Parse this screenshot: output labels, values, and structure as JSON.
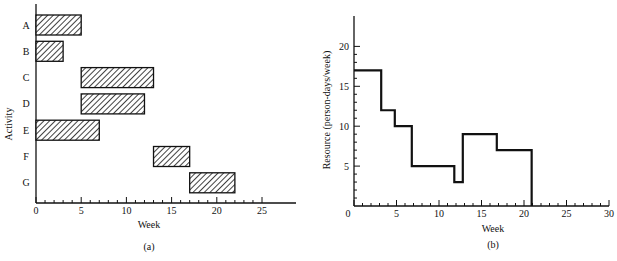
{
  "chart_data": [
    {
      "type": "bar",
      "subtype": "gantt",
      "caption": "(a)",
      "xlabel": "Week",
      "ylabel": "Activity",
      "xlim": [
        0,
        28
      ],
      "xticks": [
        0,
        5,
        10,
        15,
        20,
        25
      ],
      "categories": [
        "A",
        "B",
        "C",
        "D",
        "E",
        "F",
        "G"
      ],
      "bars": [
        {
          "activity": "A",
          "start": 0,
          "end": 5
        },
        {
          "activity": "B",
          "start": 0,
          "end": 3
        },
        {
          "activity": "C",
          "start": 5,
          "end": 13
        },
        {
          "activity": "D",
          "start": 5,
          "end": 12
        },
        {
          "activity": "E",
          "start": 0,
          "end": 7
        },
        {
          "activity": "F",
          "start": 13,
          "end": 17
        },
        {
          "activity": "G",
          "start": 17,
          "end": 22
        }
      ],
      "grid": false
    },
    {
      "type": "line",
      "subtype": "step",
      "caption": "(b)",
      "xlabel": "Week",
      "ylabel": "Resource (person-days/week)",
      "xlim": [
        0,
        30
      ],
      "ylim": [
        0,
        24
      ],
      "xticks": [
        0,
        5,
        10,
        15,
        20,
        25,
        30
      ],
      "yticks": [
        5,
        10,
        15,
        20
      ],
      "steps": [
        {
          "from": 0,
          "to": 3,
          "value": 17
        },
        {
          "from": 3,
          "to": 5,
          "value": 12
        },
        {
          "from": 5,
          "to": 7,
          "value": 10
        },
        {
          "from": 7,
          "to": 12,
          "value": 5
        },
        {
          "from": 12,
          "to": 13,
          "value": 3
        },
        {
          "from": 13,
          "to": 17,
          "value": 9
        },
        {
          "from": 17,
          "to": 22,
          "value": 7
        },
        {
          "from": 22,
          "to": 30,
          "value": 0
        }
      ],
      "grid": false
    }
  ],
  "labels": {
    "a": {
      "xlabel": "Week",
      "ylabel": "Activity",
      "caption": "(a)"
    },
    "b": {
      "xlabel": "Week",
      "ylabel": "Resource (person-days/week)",
      "caption": "(b)"
    }
  }
}
